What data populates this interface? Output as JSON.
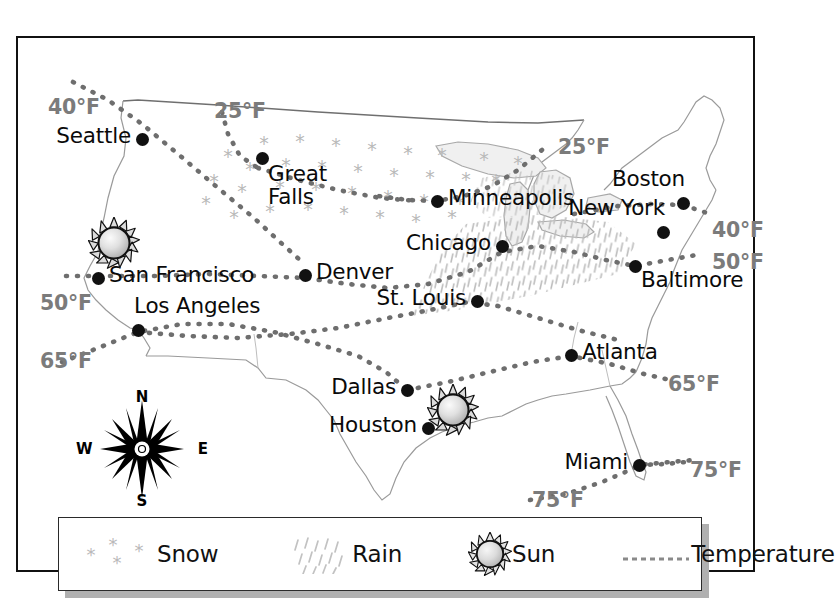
{
  "map": {
    "title": "United States Weather Map",
    "cities": [
      {
        "name": "Seattle",
        "x": 124,
        "y": 101,
        "label_pos": "r"
      },
      {
        "name": "Great\nFalls",
        "x": 244,
        "y": 120,
        "label_pos": "bl"
      },
      {
        "name": "San Francisco",
        "x": 80,
        "y": 240,
        "label_pos": "l"
      },
      {
        "name": "Los Angeles",
        "x": 120,
        "y": 292,
        "label_pos": "tl"
      },
      {
        "name": "Denver",
        "x": 287,
        "y": 237,
        "label_pos": "l"
      },
      {
        "name": "Minneapolis",
        "x": 419,
        "y": 163,
        "label_pos": "l"
      },
      {
        "name": "Chicago",
        "x": 484,
        "y": 208,
        "label_pos": "r"
      },
      {
        "name": "St. Louis",
        "x": 459,
        "y": 263,
        "label_pos": "r"
      },
      {
        "name": "New York",
        "x": 645,
        "y": 194,
        "label_pos": "tr"
      },
      {
        "name": "Boston",
        "x": 665,
        "y": 165,
        "label_pos": "tr"
      },
      {
        "name": "Baltimore",
        "x": 617,
        "y": 228,
        "label_pos": "bl"
      },
      {
        "name": "Atlanta",
        "x": 553,
        "y": 317,
        "label_pos": "l"
      },
      {
        "name": "Dallas",
        "x": 389,
        "y": 352,
        "label_pos": "r"
      },
      {
        "name": "Houston",
        "x": 410,
        "y": 390,
        "label_pos": "r"
      },
      {
        "name": "Miami",
        "x": 621,
        "y": 427,
        "label_pos": "r"
      }
    ],
    "temperature_labels": [
      {
        "value": "40°F",
        "x": 30,
        "y": 57
      },
      {
        "value": "25°F",
        "x": 196,
        "y": 61
      },
      {
        "value": "25°F",
        "x": 540,
        "y": 97
      },
      {
        "value": "40°F",
        "x": 694,
        "y": 180
      },
      {
        "value": "50°F",
        "x": 694,
        "y": 212
      },
      {
        "value": "50°F",
        "x": 22,
        "y": 253
      },
      {
        "value": "65°F",
        "x": 22,
        "y": 311
      },
      {
        "value": "65°F",
        "x": 650,
        "y": 334
      },
      {
        "value": "75°F",
        "x": 672,
        "y": 420
      },
      {
        "value": "75°F",
        "x": 514,
        "y": 450
      }
    ],
    "sun_icons": [
      {
        "location": "San Francisco",
        "x": 96,
        "y": 205
      },
      {
        "location": "Houston",
        "x": 435,
        "y": 372
      }
    ],
    "compass": {
      "north": "N",
      "east": "E",
      "south": "S",
      "west": "W"
    }
  },
  "legend": {
    "items": [
      {
        "icon": "snow-icon",
        "label": "Snow"
      },
      {
        "icon": "rain-icon",
        "label": "Rain"
      },
      {
        "icon": "sun-icon",
        "label": "Sun"
      },
      {
        "icon": "temperature-icon",
        "label": "Temperature"
      }
    ]
  },
  "colors": {
    "border": "#111111",
    "city_dot": "#111111",
    "city_label": "#0a0a0a",
    "temp_label": "#7b7b7b",
    "isotherm": "#6e6e6e",
    "snow": "#b9b9b9",
    "rain": "#c2c2c2",
    "coastline": "#9a9a9a",
    "legend_shadow": "#b0b0b0",
    "background": "#ffffff"
  }
}
